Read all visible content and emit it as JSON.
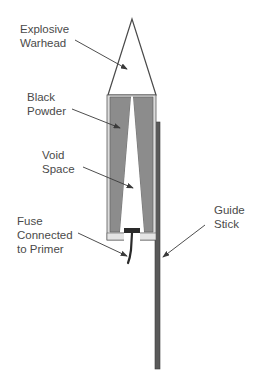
{
  "labels": {
    "warhead": [
      "Explosive",
      "Warhead"
    ],
    "powder": [
      "Black",
      "Powder"
    ],
    "void": [
      "Void",
      "Space"
    ],
    "fuse": [
      "Fuse",
      "Connected",
      "to Primer"
    ],
    "stick": [
      "Guide",
      "Stick"
    ]
  },
  "colors": {
    "line": "#4a4a4a",
    "powder": "#8c8c8c",
    "casing": "#d9d9d9",
    "stick": "#5a5a5a",
    "primer": "#2a2a2a"
  }
}
